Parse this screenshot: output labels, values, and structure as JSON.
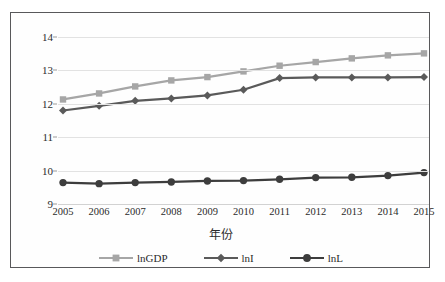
{
  "chart_data": {
    "type": "line",
    "title": "",
    "xlabel": "年份",
    "ylabel": "",
    "categories": [
      "2005",
      "2006",
      "2007",
      "2008",
      "2009",
      "2010",
      "2011",
      "2012",
      "2013",
      "2014",
      "2015"
    ],
    "ylim": [
      9,
      14
    ],
    "yticks": [
      "9",
      "10",
      "11",
      "12",
      "13",
      "14"
    ],
    "grid": true,
    "legend_position": "bottom",
    "series": [
      {
        "name": "lnGDP",
        "marker": "square",
        "color": "#a6a6a6",
        "values": [
          12.13,
          12.31,
          12.52,
          12.7,
          12.8,
          12.97,
          13.14,
          13.25,
          13.36,
          13.45,
          13.51
        ]
      },
      {
        "name": "lnI",
        "marker": "diamond",
        "color": "#5a5a5a",
        "values": [
          11.8,
          11.94,
          12.09,
          12.16,
          12.25,
          12.42,
          12.77,
          12.79,
          12.79,
          12.79,
          12.8
        ]
      },
      {
        "name": "lnL",
        "marker": "circle",
        "color": "#3d3d3d",
        "values": [
          9.64,
          9.61,
          9.64,
          9.66,
          9.69,
          9.7,
          9.74,
          9.79,
          9.8,
          9.85,
          9.94
        ]
      }
    ]
  },
  "colors": {
    "border": "#58585a",
    "grid": "#e2e2e2",
    "text": "#2b2b2b",
    "background": "#fefefe"
  }
}
